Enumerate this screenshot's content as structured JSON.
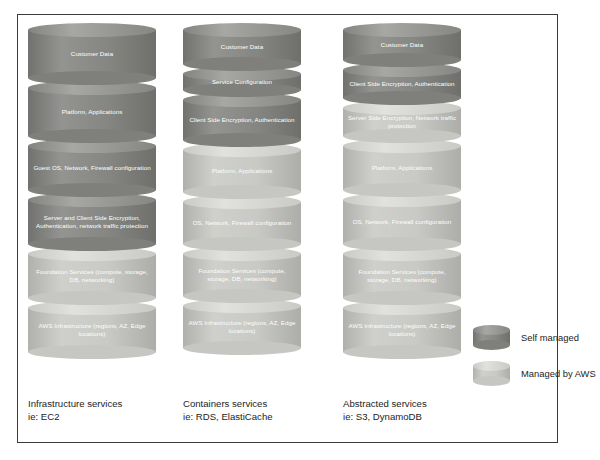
{
  "diagram": {
    "colors": {
      "self_managed": "#7f807c",
      "managed_by_aws": "#c6c7c2",
      "frame_border": "#3b3b3b",
      "background": "#ffffff",
      "label_text": "#ffffff",
      "caption_text": "#1d1d1d"
    },
    "columns": [
      {
        "id": "infrastructure-services",
        "caption_line1": "Infrastructure services",
        "caption_line2": "ie: EC2",
        "layers": [
          {
            "label": "Customer Data",
            "managed": "self",
            "height": 62
          },
          {
            "label": "Platform, Applications",
            "managed": "self",
            "height": 62
          },
          {
            "label": "Guest OS, Network, Firewall configuration",
            "managed": "self",
            "height": 58
          },
          {
            "label": "Server and Client Side Encryption, Authentication, network traffic protection",
            "managed": "self",
            "height": 58
          },
          {
            "label": "Foundation Services (compute, storage, DB, networking)",
            "managed": "aws",
            "height": 58
          },
          {
            "label": "AWS Infrastructure (regions, AZ, Edge locations)",
            "managed": "aws",
            "height": 58
          }
        ]
      },
      {
        "id": "containers-services",
        "caption_line1": "Containers services",
        "caption_line2": "ie: RDS, ElastiCache",
        "layers": [
          {
            "label": "Customer Data",
            "managed": "self",
            "height": 48
          },
          {
            "label": "Service Configuration",
            "managed": "self",
            "height": 30
          },
          {
            "label": "Client Side Encryption, Authentication",
            "managed": "self",
            "height": 54
          },
          {
            "label": "Platform, Applications",
            "managed": "aws",
            "height": 56
          },
          {
            "label": "OS, Network, Firewall configuration",
            "managed": "aws",
            "height": 56
          },
          {
            "label": "Foundation Services (compute, storage, DB, networking)",
            "managed": "aws",
            "height": 56
          },
          {
            "label": "AWS Infrastructure (regions, AZ, Edge locations)",
            "managed": "aws",
            "height": 56
          }
        ]
      },
      {
        "id": "abstracted-services",
        "caption_line1": "Abstracted services",
        "caption_line2": "ie: S3, DynamoDB",
        "layers": [
          {
            "label": "Customer Data",
            "managed": "self",
            "height": 44
          },
          {
            "label": "Client Side Encryption, Authentication",
            "managed": "self",
            "height": 42
          },
          {
            "label": "Server Side Encryption, Network traffic protection",
            "managed": "aws",
            "height": 42
          },
          {
            "label": "Platform, Applications",
            "managed": "aws",
            "height": 58
          },
          {
            "label": "OS, Network, Firewall configuration",
            "managed": "aws",
            "height": 58
          },
          {
            "label": "Foundation Services (compute, storage, DB, networking)",
            "managed": "aws",
            "height": 58
          },
          {
            "label": "AWS Infrastructure (regions, AZ, Edge locations)",
            "managed": "aws",
            "height": 58
          }
        ]
      }
    ],
    "legend": {
      "items": [
        {
          "label": "Self managed",
          "managed": "self"
        },
        {
          "label": "Managed by AWS",
          "managed": "aws"
        }
      ]
    }
  }
}
